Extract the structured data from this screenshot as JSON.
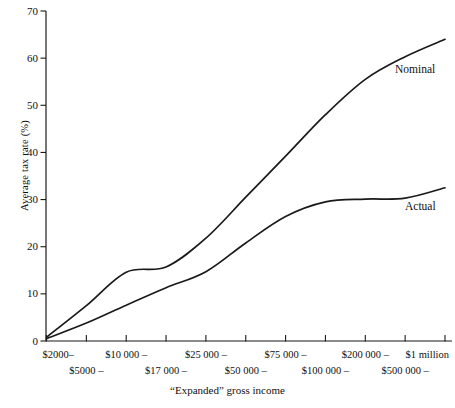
{
  "chart_data": {
    "type": "line",
    "title": "",
    "xlabel": "“Expanded” gross income",
    "ylabel": "Average tax rate (%)",
    "ylim": [
      0,
      70
    ],
    "yticks": [
      0,
      10,
      20,
      30,
      40,
      50,
      60,
      70
    ],
    "ytick_labels": [
      "0",
      "10",
      "20",
      "30",
      "40",
      "50",
      "60",
      "70"
    ],
    "grid": false,
    "legend_position": "inline-right",
    "categories": [
      "$2000–",
      "$5000 –",
      "$10 000 –",
      "$17 000 –",
      "$25 000 –",
      "$50 000 –",
      "$75 000 –",
      "$100 000 –",
      "$200 000 –",
      "$500 000 –",
      "$1 million"
    ],
    "series": [
      {
        "name": "Nominal",
        "values": [
          0.8,
          7.5,
          14.6,
          15.7,
          21.8,
          30.5,
          39.2,
          48.0,
          55.5,
          60.3,
          64.0
        ]
      },
      {
        "name": "Actual",
        "values": [
          0.5,
          3.8,
          7.6,
          11.3,
          14.7,
          20.8,
          26.4,
          29.5,
          30.1,
          30.3,
          32.5
        ]
      }
    ],
    "annotations": [
      {
        "text": "Nominal",
        "series": "Nominal"
      },
      {
        "text": "Actual",
        "series": "Actual"
      }
    ]
  },
  "axis": {
    "y_title": "Average tax rate (%)",
    "x_title": "“Expanded” gross income"
  },
  "colors": {
    "line": "#1a1a1a",
    "axis": "#1a1a1a",
    "background": "#ffffff"
  }
}
